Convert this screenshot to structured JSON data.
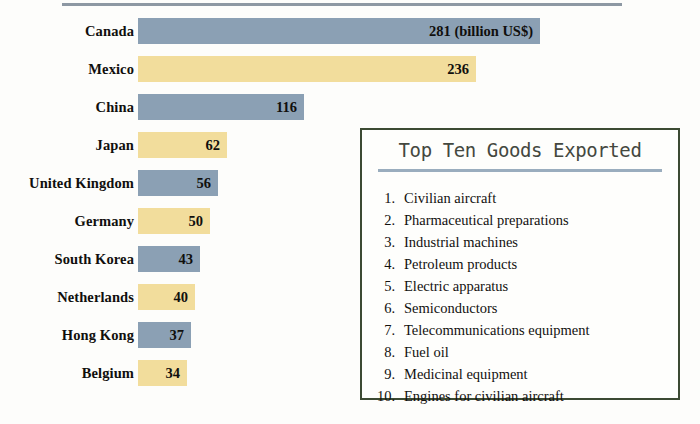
{
  "chart_data": {
    "type": "bar",
    "title": "",
    "xlabel": "",
    "ylabel": "",
    "orientation": "horizontal",
    "unit_note": "(billion US$)",
    "categories": [
      "Canada",
      "Mexico",
      "China",
      "Japan",
      "United Kingdom",
      "Germany",
      "South Korea",
      "Netherlands",
      "Hong Kong",
      "Belgium"
    ],
    "values": [
      281,
      236,
      116,
      62,
      56,
      50,
      43,
      40,
      37,
      34
    ],
    "value_labels": [
      "281 (billion US$)",
      "236",
      "116",
      "62",
      "56",
      "50",
      "43",
      "40",
      "37",
      "34"
    ],
    "bar_colors": [
      "blue",
      "gold",
      "blue",
      "gold",
      "blue",
      "gold",
      "blue",
      "gold",
      "blue",
      "gold"
    ],
    "xlim": [
      0,
      281
    ],
    "grid": false,
    "legend": "none"
  },
  "colors": {
    "bar_blue": "#8ba0b4",
    "bar_gold": "#f2dd9c",
    "panel_border": "#3c4a33",
    "panel_divider": "#9aadbe",
    "title_text": "#44483f",
    "body_text": "#12110f"
  },
  "panel": {
    "title": "Top Ten Goods Exported",
    "items": [
      {
        "number": "1.",
        "text": "Civilian aircraft"
      },
      {
        "number": "2.",
        "text": "Pharmaceutical preparations"
      },
      {
        "number": "3.",
        "text": "Industrial machines"
      },
      {
        "number": "4.",
        "text": "Petroleum products"
      },
      {
        "number": "5.",
        "text": "Electric apparatus"
      },
      {
        "number": "6.",
        "text": "Semiconductors"
      },
      {
        "number": "7.",
        "text": "Telecommunications equipment"
      },
      {
        "number": "8.",
        "text": "Fuel oil"
      },
      {
        "number": "9.",
        "text": "Medicinal equipment"
      },
      {
        "number": "10.",
        "text": "Engines for civilian aircraft"
      }
    ]
  }
}
